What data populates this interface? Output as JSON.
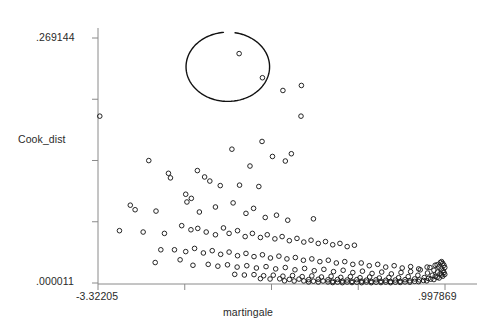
{
  "chart_data": {
    "type": "scatter",
    "title": "",
    "xlabel": "martingale",
    "ylabel": "Cook_dist",
    "xlim": [
      -3.32205,
      0.997869
    ],
    "ylim": [
      1.1e-05,
      0.269144
    ],
    "x_tick_labels": [
      "-3.32205",
      "",
      "",
      "",
      ".997869"
    ],
    "y_tick_labels": [
      ".269144",
      "",
      "",
      "",
      ".000011"
    ],
    "x_ticks": [
      -3.32205,
      -2.24207,
      -1.16209,
      -0.08211,
      0.997869
    ],
    "y_ticks": [
      0.269144,
      0.201861,
      0.134578,
      0.067294,
      1.1e-05
    ],
    "grid": false,
    "legend": null,
    "marker": "open-circle",
    "annotations": [
      {
        "type": "ellipse",
        "name": "outlier-ellipse",
        "cx": -1.706,
        "cy": 0.2375,
        "rx": 0.52,
        "ry": 0.038,
        "note": "hand-drawn ellipse circling four high Cook's distance outliers"
      }
    ],
    "points": [
      [
        -1.565,
        0.252
      ],
      [
        -1.275,
        0.2255
      ],
      [
        -1.02,
        0.2115
      ],
      [
        -0.79,
        0.217
      ],
      [
        -3.3,
        0.1833
      ],
      [
        -0.795,
        0.1833
      ],
      [
        -0.915,
        0.142
      ],
      [
        -0.99,
        0.134
      ],
      [
        -2.69,
        0.1345
      ],
      [
        -2.445,
        0.1205
      ],
      [
        -2.42,
        0.1155
      ],
      [
        -2.085,
        0.1235
      ],
      [
        -1.995,
        0.1165
      ],
      [
        -1.93,
        0.112
      ],
      [
        -1.8,
        0.107
      ],
      [
        -1.56,
        0.1075
      ],
      [
        -1.32,
        0.106
      ],
      [
        -2.92,
        0.0855
      ],
      [
        -2.86,
        0.0805
      ],
      [
        -2.6,
        0.079
      ],
      [
        -2.23,
        0.0975
      ],
      [
        -2.215,
        0.089
      ],
      [
        -2.16,
        0.093
      ],
      [
        -2.06,
        0.078
      ],
      [
        -1.86,
        0.0835
      ],
      [
        -1.64,
        0.088
      ],
      [
        -1.48,
        0.0765
      ],
      [
        -1.385,
        0.082
      ],
      [
        -1.24,
        0.072
      ],
      [
        -1.1,
        0.0745
      ],
      [
        -0.96,
        0.069
      ],
      [
        -0.64,
        0.0705
      ],
      [
        -3.055,
        0.0575
      ],
      [
        -2.76,
        0.056
      ],
      [
        -2.495,
        0.0545
      ],
      [
        -2.28,
        0.063
      ],
      [
        -2.165,
        0.0585
      ],
      [
        -2.08,
        0.06
      ],
      [
        -1.975,
        0.056
      ],
      [
        -1.86,
        0.053
      ],
      [
        -1.76,
        0.0605
      ],
      [
        -1.69,
        0.0545
      ],
      [
        -1.585,
        0.0575
      ],
      [
        -1.49,
        0.051
      ],
      [
        -1.4,
        0.0545
      ],
      [
        -1.3,
        0.05
      ],
      [
        -1.215,
        0.053
      ],
      [
        -1.12,
        0.0485
      ],
      [
        -1.03,
        0.051
      ],
      [
        -0.94,
        0.0465
      ],
      [
        -0.845,
        0.049
      ],
      [
        -0.76,
        0.045
      ],
      [
        -0.67,
        0.047
      ],
      [
        -0.58,
        0.0435
      ],
      [
        -0.49,
        0.0455
      ],
      [
        -0.4,
        0.042
      ],
      [
        -0.31,
        0.0435
      ],
      [
        -0.22,
        0.04
      ],
      [
        -0.13,
        0.0415
      ],
      [
        -2.37,
        0.0365
      ],
      [
        -2.23,
        0.0345
      ],
      [
        -2.12,
        0.038
      ],
      [
        -2.01,
        0.033
      ],
      [
        -1.9,
        0.0355
      ],
      [
        -1.795,
        0.0315
      ],
      [
        -1.69,
        0.034
      ],
      [
        -1.585,
        0.03
      ],
      [
        -1.48,
        0.0325
      ],
      [
        -1.38,
        0.029
      ],
      [
        -1.275,
        0.031
      ],
      [
        -1.175,
        0.0275
      ],
      [
        -1.07,
        0.0295
      ],
      [
        -0.97,
        0.0265
      ],
      [
        -0.865,
        0.028
      ],
      [
        -0.765,
        0.025
      ],
      [
        -0.66,
        0.0265
      ],
      [
        -0.56,
        0.0235
      ],
      [
        -0.455,
        0.025
      ],
      [
        -0.355,
        0.022
      ],
      [
        -0.25,
        0.0235
      ],
      [
        -0.15,
        0.0205
      ],
      [
        -0.045,
        0.022
      ],
      [
        0.055,
        0.019
      ],
      [
        0.16,
        0.0205
      ],
      [
        0.26,
        0.0175
      ],
      [
        0.365,
        0.019
      ],
      [
        0.465,
        0.0165
      ],
      [
        0.57,
        0.018
      ],
      [
        0.67,
        0.0155
      ],
      [
        0.775,
        0.0175
      ],
      [
        0.875,
        0.0195
      ],
      [
        0.94,
        0.0225
      ],
      [
        -1.95,
        0.0205
      ],
      [
        -1.83,
        0.0185
      ],
      [
        -1.71,
        0.02
      ],
      [
        -1.59,
        0.0175
      ],
      [
        -1.47,
        0.019
      ],
      [
        -1.35,
        0.0165
      ],
      [
        -1.23,
        0.018
      ],
      [
        -1.11,
        0.0155
      ],
      [
        -0.99,
        0.017
      ],
      [
        -0.87,
        0.0145
      ],
      [
        -0.75,
        0.016
      ],
      [
        -0.63,
        0.0135
      ],
      [
        -0.51,
        0.015
      ],
      [
        -0.39,
        0.0125
      ],
      [
        -0.27,
        0.014
      ],
      [
        -0.15,
        0.0115
      ],
      [
        -0.03,
        0.013
      ],
      [
        0.09,
        0.0105
      ],
      [
        0.21,
        0.012
      ],
      [
        0.33,
        0.01
      ],
      [
        0.45,
        0.0115
      ],
      [
        0.57,
        0.0125
      ],
      [
        0.69,
        0.0145
      ],
      [
        0.81,
        0.017
      ],
      [
        0.9,
        0.02
      ],
      [
        0.955,
        0.0235
      ],
      [
        -1.62,
        0.0095
      ],
      [
        -1.5,
        0.0088
      ],
      [
        -1.38,
        0.0092
      ],
      [
        -1.26,
        0.008
      ],
      [
        -1.14,
        0.0086
      ],
      [
        -1.02,
        0.0075
      ],
      [
        -0.9,
        0.0082
      ],
      [
        -0.78,
        0.007
      ],
      [
        -0.66,
        0.0078
      ],
      [
        -0.54,
        0.0066
      ],
      [
        -0.42,
        0.0074
      ],
      [
        -0.3,
        0.0062
      ],
      [
        -0.18,
        0.007
      ],
      [
        -0.06,
        0.0058
      ],
      [
        0.06,
        0.0066
      ],
      [
        0.18,
        0.0055
      ],
      [
        0.3,
        0.0062
      ],
      [
        0.42,
        0.0058
      ],
      [
        0.54,
        0.007
      ],
      [
        0.66,
        0.0085
      ],
      [
        0.78,
        0.011
      ],
      [
        0.86,
        0.014
      ],
      [
        0.92,
        0.0175
      ],
      [
        0.97,
        0.0215
      ],
      [
        -1.3,
        0.0048
      ],
      [
        -1.18,
        0.0044
      ],
      [
        -1.06,
        0.0046
      ],
      [
        -0.94,
        0.004
      ],
      [
        -0.82,
        0.0043
      ],
      [
        -0.7,
        0.0037
      ],
      [
        -0.58,
        0.0041
      ],
      [
        -0.46,
        0.0035
      ],
      [
        -0.34,
        0.0039
      ],
      [
        -0.22,
        0.0033
      ],
      [
        -0.1,
        0.0037
      ],
      [
        0.02,
        0.0031
      ],
      [
        0.14,
        0.0035
      ],
      [
        0.26,
        0.003
      ],
      [
        0.38,
        0.0033
      ],
      [
        0.5,
        0.0036
      ],
      [
        0.62,
        0.0045
      ],
      [
        0.74,
        0.006
      ],
      [
        0.84,
        0.0085
      ],
      [
        0.905,
        0.012
      ],
      [
        0.95,
        0.0155
      ],
      [
        0.985,
        0.0195
      ],
      [
        -1.0,
        0.0024
      ],
      [
        -0.88,
        0.0022
      ],
      [
        -0.76,
        0.0023
      ],
      [
        -0.64,
        0.002
      ],
      [
        -0.52,
        0.0022
      ],
      [
        -0.4,
        0.0019
      ],
      [
        -0.28,
        0.0021
      ],
      [
        -0.16,
        0.0018
      ],
      [
        -0.04,
        0.002
      ],
      [
        0.08,
        0.0017
      ],
      [
        0.2,
        0.0019
      ],
      [
        0.32,
        0.0016
      ],
      [
        0.44,
        0.0019
      ],
      [
        0.56,
        0.0024
      ],
      [
        0.68,
        0.0034
      ],
      [
        0.79,
        0.005
      ],
      [
        0.875,
        0.0072
      ],
      [
        0.935,
        0.01
      ],
      [
        0.975,
        0.0135
      ],
      [
        0.995,
        0.017
      ],
      [
        -0.7,
        0.0012
      ],
      [
        -0.58,
        0.0011
      ],
      [
        -0.46,
        0.0012
      ],
      [
        -0.34,
        0.001
      ],
      [
        -0.22,
        0.0011
      ],
      [
        -0.1,
        0.0009
      ],
      [
        0.02,
        0.0011
      ],
      [
        0.14,
        0.0009
      ],
      [
        0.26,
        0.001
      ],
      [
        0.38,
        0.0009
      ],
      [
        0.5,
        0.0012
      ],
      [
        0.62,
        0.0018
      ],
      [
        0.73,
        0.0028
      ],
      [
        0.82,
        0.0042
      ],
      [
        0.9,
        0.0062
      ],
      [
        0.955,
        0.0088
      ],
      [
        0.985,
        0.0115
      ],
      [
        -0.4,
        0.0005
      ],
      [
        -0.28,
        0.0004
      ],
      [
        -0.16,
        0.0005
      ],
      [
        -0.04,
        0.0004
      ],
      [
        0.08,
        0.0004
      ],
      [
        0.2,
        0.0005
      ],
      [
        0.32,
        0.0004
      ],
      [
        0.44,
        0.0006
      ],
      [
        0.56,
        0.0009
      ],
      [
        0.67,
        0.0015
      ],
      [
        0.77,
        0.0024
      ],
      [
        0.86,
        0.0038
      ],
      [
        0.925,
        0.0055
      ],
      [
        0.97,
        0.0075
      ],
      [
        0.995,
        0.0095
      ],
      [
        -2.54,
        0.0365
      ],
      [
        -2.3,
        0.0255
      ],
      [
        -2.61,
        0.0225
      ],
      [
        -2.14,
        0.0195
      ],
      [
        -1.28,
        0.1555
      ],
      [
        -1.655,
        0.147
      ],
      [
        -1.43,
        0.1285
      ],
      [
        -1.15,
        0.139
      ]
    ]
  },
  "colors": {
    "axis": "#808080",
    "marker": "#1a1a1a",
    "annotation": "#111111",
    "text": "#2a2a2a",
    "background": "#ffffff"
  }
}
